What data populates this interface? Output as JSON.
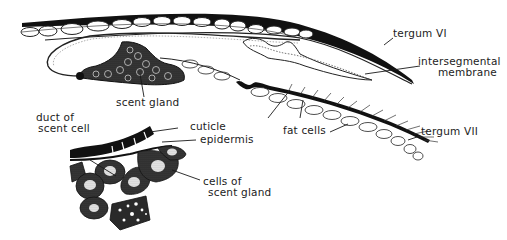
{
  "figure": {
    "type": "anatomical-diagram",
    "colors": {
      "ink": "#1a1a1a",
      "stipple": "#5a5a5a",
      "dark_fill": "#111111",
      "light_fill": "#ffffff"
    }
  },
  "labels": {
    "tergum_vi": "tergum VI",
    "intersegmental_line1": "intersegmental",
    "intersegmental_line2": "membrane",
    "scent_gland": "scent gland",
    "tergum_vii": "tergum VII",
    "fat_cells": "fat cells",
    "duct_line1": "duct of",
    "duct_line2": "scent cell",
    "cuticle": "cuticle",
    "epidermis": "epidermis",
    "cells_line1": "cells of",
    "cells_line2": "scent gland"
  }
}
